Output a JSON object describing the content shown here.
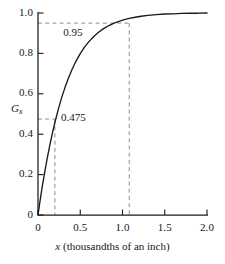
{
  "chart_data": {
    "type": "line",
    "title": "",
    "subtitle": "",
    "xlabel_prefix": "x",
    "xlabel_rest": " (thousandths of an inch)",
    "xlabel": "x (thousandths of an inch)",
    "ylabel_main": "G",
    "ylabel_sub": "x",
    "ylabel": "Gx",
    "xlim": [
      0,
      2.0
    ],
    "ylim": [
      0,
      1.0
    ],
    "grid": false,
    "legend": "none",
    "x_ticks": [
      {
        "value": 0,
        "label": "0"
      },
      {
        "value": 0.5,
        "label": "0.5"
      },
      {
        "value": 1.0,
        "label": "1.0"
      },
      {
        "value": 1.5,
        "label": "1.5"
      },
      {
        "value": 2.0,
        "label": "2.0"
      }
    ],
    "y_ticks": [
      {
        "value": 0,
        "label": "0"
      },
      {
        "value": 0.2,
        "label": "0.2"
      },
      {
        "value": 0.4,
        "label": "0.4"
      },
      {
        "value": 0.6,
        "label": "0.6"
      },
      {
        "value": 0.8,
        "label": "0.8"
      },
      {
        "value": 1.0,
        "label": "1.0"
      }
    ],
    "series": [
      {
        "name": "Gx",
        "x": [
          0.0,
          0.02,
          0.05,
          0.08,
          0.11,
          0.14,
          0.17,
          0.2,
          0.24,
          0.28,
          0.32,
          0.36,
          0.4,
          0.45,
          0.5,
          0.55,
          0.6,
          0.66,
          0.72,
          0.78,
          0.84,
          0.9,
          0.96,
          1.02,
          1.08,
          1.15,
          1.22,
          1.3,
          1.4,
          1.5,
          1.6,
          1.7,
          1.8,
          1.9,
          2.0
        ],
        "y": [
          0.0,
          0.058,
          0.14,
          0.214,
          0.283,
          0.346,
          0.404,
          0.458,
          0.523,
          0.581,
          0.632,
          0.677,
          0.718,
          0.762,
          0.799,
          0.831,
          0.857,
          0.884,
          0.906,
          0.924,
          0.938,
          0.95,
          0.959,
          0.967,
          0.973,
          0.979,
          0.984,
          0.988,
          0.992,
          0.995,
          0.996,
          0.998,
          0.999,
          0.999,
          1.0
        ]
      }
    ],
    "annotations": [
      {
        "name": "upper-guide",
        "label": "0.95",
        "y_value": 0.95,
        "x_value": 1.08,
        "horizontal_from_x": 0.0,
        "vertical_to_y": 0.0,
        "style": "dashed"
      },
      {
        "name": "lower-guide",
        "label": "0.475",
        "y_value": 0.475,
        "x_value": 0.2,
        "horizontal_from_x": 0.0,
        "vertical_to_y": 0.0,
        "style": "dashed"
      }
    ],
    "colors": {
      "curve": "#1a1a1a",
      "axis": "#1a1a1a",
      "guide": "#8d8d8d",
      "background": "#ffffff",
      "text": "#161616"
    }
  }
}
